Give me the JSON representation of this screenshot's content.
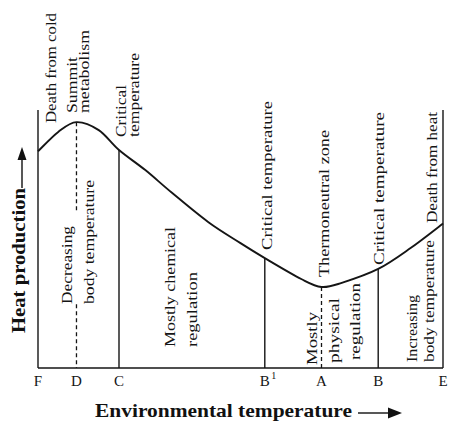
{
  "chart_data": {
    "type": "line",
    "title": "",
    "xlabel": "Environmental temperature",
    "ylabel": "Heat production",
    "axis_units": "arbitrary (no numeric scale shown)",
    "xlim": [
      0,
      100
    ],
    "ylim": [
      0,
      100
    ],
    "grid": false,
    "legend": "none",
    "ticks": [
      {
        "label": "F",
        "x": 0
      },
      {
        "label": "D",
        "x": 9.5
      },
      {
        "label": "C",
        "x": 20
      },
      {
        "label": "B",
        "sup": "1",
        "x": 56
      },
      {
        "label": "A",
        "x": 70
      },
      {
        "label": "B",
        "x": 84
      },
      {
        "label": "E",
        "x": 100
      }
    ],
    "series": [
      {
        "name": "Heat production",
        "points": [
          [
            0,
            84
          ],
          [
            5,
            91.5
          ],
          [
            9.5,
            95.3
          ],
          [
            15,
            92.2
          ],
          [
            20,
            84.5
          ],
          [
            26.5,
            76.7
          ],
          [
            33,
            68
          ],
          [
            42,
            56.6
          ],
          [
            50,
            48.4
          ],
          [
            56,
            42.6
          ],
          [
            65,
            34.5
          ],
          [
            70,
            31.4
          ],
          [
            75,
            33
          ],
          [
            84,
            38.4
          ],
          [
            92,
            46.5
          ],
          [
            100,
            56
          ]
        ]
      }
    ],
    "markers": [
      {
        "tick": "F",
        "x": 0,
        "style": "solid",
        "extent": "full"
      },
      {
        "tick": "D",
        "x": 9.5,
        "style": "dashed",
        "extent": "to-curve"
      },
      {
        "tick": "C",
        "x": 20,
        "style": "solid",
        "extent": "to-curve"
      },
      {
        "tick": "B1",
        "x": 56,
        "style": "solid",
        "extent": "to-curve"
      },
      {
        "tick": "A",
        "x": 70,
        "style": "dashed",
        "extent": "to-curve"
      },
      {
        "tick": "B",
        "x": 84,
        "style": "solid",
        "extent": "to-curve"
      },
      {
        "tick": "E",
        "x": 100,
        "style": "solid",
        "extent": "full"
      }
    ],
    "annotations": [
      {
        "id": "death-from-cold",
        "lines": [
          "Death from cold"
        ]
      },
      {
        "id": "summit-metabolism",
        "lines": [
          "Summit",
          "metabolism"
        ]
      },
      {
        "id": "critical-temperature-c",
        "lines": [
          "Critical",
          "temperature"
        ]
      },
      {
        "id": "decreasing-body-temperature",
        "lines": [
          "Decreasing",
          "body temperature"
        ]
      },
      {
        "id": "mostly-chemical-regulation",
        "lines": [
          "Mostly chemical",
          "regulation"
        ]
      },
      {
        "id": "critical-temperature-b1",
        "lines": [
          "Critical temperature"
        ]
      },
      {
        "id": "thermoneutral-zone",
        "lines": [
          "Thermoneutral zone"
        ]
      },
      {
        "id": "critical-temperature-b",
        "lines": [
          "Critical temperature"
        ]
      },
      {
        "id": "mostly-physical-regulation",
        "lines": [
          "Mostly",
          "physical",
          "regulation"
        ]
      },
      {
        "id": "increasing-body-temperature",
        "lines": [
          "Increasing",
          "body temperature"
        ]
      },
      {
        "id": "death-from-heat",
        "lines": [
          "Death from heat"
        ]
      }
    ],
    "colors": {
      "ink": "#151515",
      "background": "#ffffff"
    }
  }
}
